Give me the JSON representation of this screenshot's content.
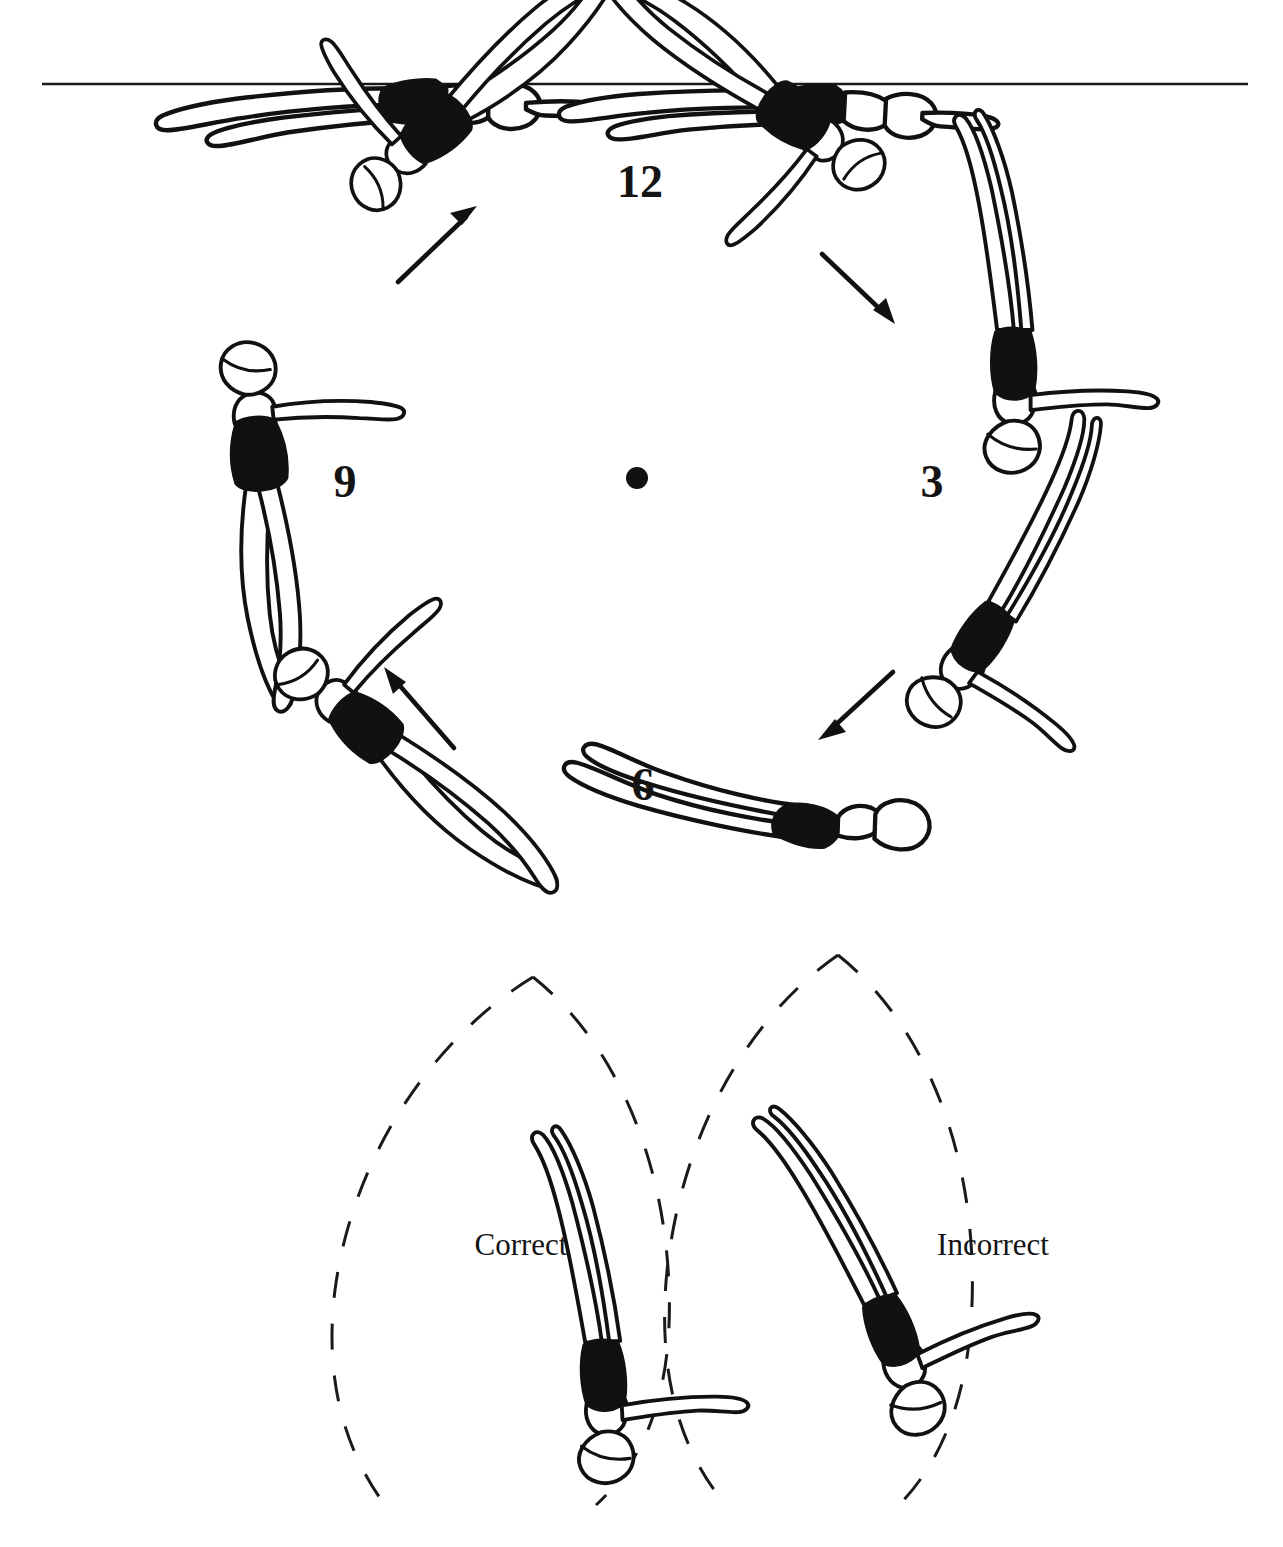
{
  "figure": {
    "background_color": "#ffffff",
    "ink_color": "#111111",
    "width": 1283,
    "height": 1547
  },
  "clock": {
    "center": {
      "x": 637,
      "y": 478
    },
    "radius": 300,
    "center_dot_label": "center-dot",
    "numerals": [
      {
        "id": "twelve",
        "label": "12",
        "x": 640,
        "y": 197
      },
      {
        "id": "three",
        "label": "3",
        "x": 932,
        "y": 497
      },
      {
        "id": "six",
        "label": "6",
        "x": 643,
        "y": 800
      },
      {
        "id": "nine",
        "label": "9",
        "x": 345,
        "y": 497
      }
    ],
    "arrows": [
      {
        "id": "arrow-upper-left",
        "from": {
          "x": 398,
          "y": 282
        },
        "to": {
          "x": 475,
          "y": 208
        },
        "direction": "up-right"
      },
      {
        "id": "arrow-upper-right",
        "from": {
          "x": 820,
          "y": 253
        },
        "to": {
          "x": 893,
          "y": 322
        },
        "direction": "down-right"
      },
      {
        "id": "arrow-lower-left",
        "from": {
          "x": 454,
          "y": 748
        },
        "to": {
          "x": 385,
          "y": 668
        },
        "direction": "up-left"
      },
      {
        "id": "arrow-lower-right",
        "from": {
          "x": 893,
          "y": 672
        },
        "to": {
          "x": 818,
          "y": 739
        },
        "direction": "down-left"
      }
    ],
    "swimmer_positions": [
      {
        "id": "pos-11-oclock-surface",
        "clock": "11",
        "pose": "horizontal-front-layout-at-surface"
      },
      {
        "id": "pos-1-oclock-surface",
        "clock": "1",
        "pose": "horizontal-back-layout-at-surface"
      },
      {
        "id": "pos-10-oclock",
        "clock": "10",
        "pose": "diagonal-descending"
      },
      {
        "id": "pos-2-oclock",
        "clock": "2",
        "pose": "diagonal-descending"
      },
      {
        "id": "pos-9-oclock",
        "clock": "9",
        "pose": "vertical-head-up"
      },
      {
        "id": "pos-3-oclock",
        "clock": "3",
        "pose": "vertical-head-down"
      },
      {
        "id": "pos-8-oclock",
        "clock": "8",
        "pose": "diagonal-ascending"
      },
      {
        "id": "pos-4-oclock",
        "clock": "4",
        "pose": "diagonal-ascending"
      },
      {
        "id": "pos-6-oclock",
        "clock": "6",
        "pose": "horizontal-inverted-layout"
      }
    ]
  },
  "waterline": {
    "id": "water-surface-line",
    "x_start": 42,
    "x_end": 1248,
    "y": 84
  },
  "comparison": {
    "correct": {
      "label": "Correct",
      "label_x": 478,
      "label_y": 1255,
      "arc_id": "correct-path-arc",
      "alignment": "body vertical, perpendicular to the circular path"
    },
    "incorrect": {
      "label": "Incorrect",
      "label_x": 948,
      "label_y": 1255,
      "arc_id": "incorrect-path-arc",
      "alignment": "body tilted off the circular path"
    }
  }
}
